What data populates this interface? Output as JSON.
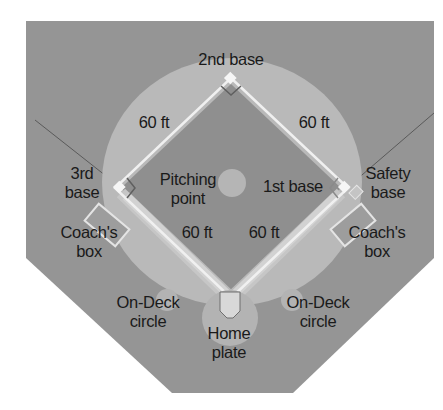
{
  "colors": {
    "background": "#ffffff",
    "field": "#959595",
    "infield": "#8f8f8f",
    "outfield_arc": "#b8b8b8",
    "base_path": "#c4c4c4",
    "base_line": "#eeeeee",
    "text": "#1a1a1a"
  },
  "labels": {
    "second_base": "2nd base",
    "third_base_line1": "3rd",
    "third_base_line2": "base",
    "first_base": "1st base",
    "safety_base_line1": "Safety",
    "safety_base_line2": "base",
    "pitching_point_line1": "Pitching",
    "pitching_point_line2": "point",
    "home_plate_line1": "Home",
    "home_plate_line2": "plate",
    "coach_box_left_line1": "Coach's",
    "coach_box_left_line2": "box",
    "coach_box_right_line1": "Coach's",
    "coach_box_right_line2": "box",
    "on_deck_left_line1": "On-Deck",
    "on_deck_left_line2": "circle",
    "on_deck_right_line1": "On-Deck",
    "on_deck_right_line2": "circle"
  },
  "distances": {
    "home_to_first": "60 ft",
    "first_to_second": "60 ft",
    "second_to_third": "60 ft",
    "third_to_home": "60 ft"
  }
}
